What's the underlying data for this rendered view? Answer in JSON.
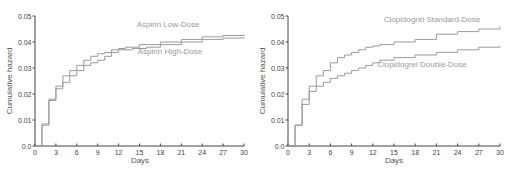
{
  "chart_data": [
    {
      "type": "line",
      "step": true,
      "title": "",
      "xlabel": "Days",
      "ylabel": "Cumulative hazard",
      "xlim": [
        0,
        30
      ],
      "ylim": [
        0,
        0.05
      ],
      "xticks": [
        "0",
        "3",
        "6",
        "9",
        "12",
        "15",
        "18",
        "21",
        "24",
        "27",
        "30"
      ],
      "yticks": [
        "0.0",
        "0.01",
        "0.02",
        "0.03",
        "0.04",
        "0.05"
      ],
      "grid": false,
      "legend": "inline labels",
      "series": [
        {
          "name": "Aspirin Low-Dose",
          "x": [
            0,
            1,
            2,
            3,
            4,
            5,
            6,
            7,
            8,
            9,
            10,
            11,
            12,
            13,
            15,
            18,
            21,
            24,
            27,
            30
          ],
          "values": [
            0,
            0.0085,
            0.018,
            0.023,
            0.027,
            0.029,
            0.031,
            0.033,
            0.0345,
            0.0355,
            0.036,
            0.037,
            0.0375,
            0.038,
            0.039,
            0.04,
            0.041,
            0.042,
            0.0425,
            0.043
          ]
        },
        {
          "name": "Aspirin High-Dose",
          "x": [
            0,
            1,
            2,
            3,
            4,
            5,
            6,
            7,
            8,
            9,
            10,
            11,
            12,
            14,
            16,
            18,
            21,
            24,
            27,
            30
          ],
          "values": [
            0,
            0.008,
            0.0175,
            0.022,
            0.0245,
            0.027,
            0.029,
            0.031,
            0.032,
            0.033,
            0.0345,
            0.036,
            0.037,
            0.0375,
            0.038,
            0.039,
            0.04,
            0.041,
            0.0415,
            0.042
          ]
        }
      ]
    },
    {
      "type": "line",
      "step": true,
      "title": "",
      "xlabel": "Days",
      "ylabel": "Cumulative hazard",
      "xlim": [
        0,
        30
      ],
      "ylim": [
        0,
        0.05
      ],
      "xticks": [
        "0",
        "3",
        "6",
        "9",
        "12",
        "15",
        "18",
        "21",
        "24",
        "27",
        "30"
      ],
      "yticks": [
        "0.0",
        "0.01",
        "0.02",
        "0.03",
        "0.04",
        "0.05"
      ],
      "grid": false,
      "legend": "inline labels",
      "series": [
        {
          "name": "Clopidogrel Standard-Dose",
          "x": [
            0,
            1,
            2,
            3,
            4,
            5,
            6,
            7,
            8,
            9,
            10,
            11,
            12,
            13,
            15,
            18,
            21,
            24,
            27,
            30
          ],
          "values": [
            0,
            0.008,
            0.018,
            0.023,
            0.027,
            0.029,
            0.032,
            0.034,
            0.035,
            0.036,
            0.037,
            0.038,
            0.0385,
            0.039,
            0.04,
            0.041,
            0.043,
            0.044,
            0.045,
            0.046
          ]
        },
        {
          "name": "Clopidogrel Double-Dose",
          "x": [
            0,
            1,
            2,
            3,
            4,
            5,
            6,
            7,
            8,
            9,
            10,
            11,
            12,
            13,
            15,
            18,
            21,
            24,
            27,
            30
          ],
          "values": [
            0,
            0.008,
            0.016,
            0.021,
            0.023,
            0.0245,
            0.026,
            0.027,
            0.028,
            0.029,
            0.03,
            0.031,
            0.032,
            0.033,
            0.034,
            0.035,
            0.036,
            0.037,
            0.038,
            0.0385
          ]
        }
      ]
    }
  ],
  "charts": [
    {
      "xlabel": "Days",
      "ylabel": "Cumulative hazard",
      "label_top": "Aspirin Low-Dose",
      "label_bottom": "Aspirin High-Dose"
    },
    {
      "xlabel": "Days",
      "ylabel": "Cumulative hazard",
      "label_top": "Clopidogrel Standard-Dose",
      "label_bottom": "Clopidogrel Double-Dose"
    }
  ],
  "colors": {
    "series": "#9a9a9a",
    "axis": "#444444"
  }
}
